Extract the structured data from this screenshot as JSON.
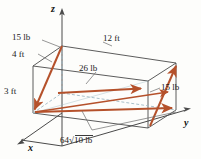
{
  "figure": {
    "kind": "3d-force-diagram",
    "background_color": "#fdfdfb",
    "vector_color": "#b5512b",
    "edge_color": "#4a4a4a",
    "hidden_edge_color": "#9fb9c4",
    "axes": {
      "z_label": "z",
      "x_label": "x",
      "y_label": "y"
    },
    "dimensions": [
      {
        "id": "width",
        "label": "4 ft"
      },
      {
        "id": "length",
        "label": "12 ft"
      },
      {
        "id": "height",
        "label": "3 ft"
      }
    ],
    "forces": [
      {
        "id": "force-top-left",
        "label": "15 lb"
      },
      {
        "id": "force-middle",
        "label": "26 lb"
      },
      {
        "id": "force-right",
        "label": "15 lb"
      },
      {
        "id": "force-diagonal",
        "coefficient": "64",
        "radical": "10",
        "unit": "lb",
        "label": "64√10 lb"
      }
    ]
  }
}
